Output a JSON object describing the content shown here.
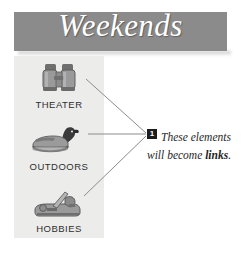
{
  "banner": {
    "title": "Weekends",
    "background_color": "#8b8b8b",
    "title_color": "#ffffff"
  },
  "panel": {
    "background_color": "#ececeb",
    "items": [
      {
        "label": "THEATER",
        "icon": "binoculars-icon"
      },
      {
        "label": "OUTDOORS",
        "icon": "duck-decoy-icon"
      },
      {
        "label": "HOBBIES",
        "icon": "hand-plane-icon"
      }
    ]
  },
  "callout": {
    "number": "1",
    "text_before": "These elements will become ",
    "text_bold": "links",
    "text_after": ".",
    "number_background": "#1c1c1c",
    "number_color": "#ffffff"
  },
  "connectors": {
    "color": "#8c8c8c",
    "count": 3
  }
}
